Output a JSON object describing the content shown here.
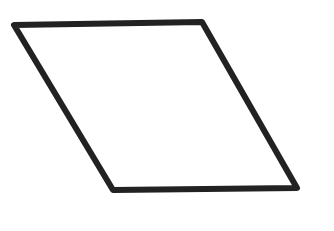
{
  "diagram": {
    "shape": "parallelogram",
    "stroke_color": "#222222",
    "fill_color": "#ffffff",
    "stroke_width": 6,
    "vertices": {
      "top_left": [
        14,
        25
      ],
      "top_right": [
        202,
        22
      ],
      "bottom_right": [
        297,
        188
      ],
      "bottom_left": [
        113,
        190
      ]
    }
  }
}
